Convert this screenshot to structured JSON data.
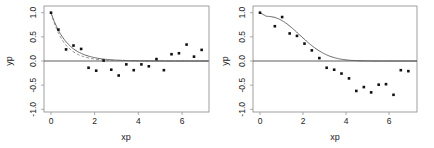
{
  "chart_data": [
    {
      "type": "scatter",
      "title": "",
      "xlabel": "xp",
      "ylabel": "yp",
      "xlim": [
        -0.2,
        7.0
      ],
      "ylim": [
        -1.1,
        1.1
      ],
      "xticks": [
        "0",
        "2",
        "4",
        "6"
      ],
      "yticks": [
        "-1.0",
        "-0.5",
        "0.0",
        "0.5",
        "1.0"
      ],
      "grid": false,
      "hline": 0,
      "points": {
        "x": [
          0,
          0.34,
          0.69,
          1.03,
          1.38,
          1.72,
          2.07,
          2.41,
          2.76,
          3.1,
          3.45,
          3.79,
          4.14,
          4.48,
          4.83,
          5.17,
          5.52,
          5.86,
          6.21,
          6.55,
          6.9
        ],
        "y": [
          1.0,
          0.65,
          0.24,
          0.32,
          0.25,
          -0.14,
          -0.2,
          0.01,
          -0.18,
          -0.3,
          -0.07,
          -0.19,
          -0.07,
          -0.11,
          0.04,
          -0.19,
          0.14,
          0.16,
          0.34,
          0.09,
          0.23
        ]
      },
      "series": [
        {
          "name": "fit-solid",
          "style": "solid",
          "form": "exp(-x/0.75)"
        },
        {
          "name": "fit-dashed",
          "style": "dashed",
          "form": "exp(-x/0.62)"
        }
      ]
    },
    {
      "type": "scatter",
      "title": "",
      "xlabel": "xp",
      "ylabel": "yp",
      "xlim": [
        -0.2,
        7.0
      ],
      "ylim": [
        -1.1,
        1.1
      ],
      "xticks": [
        "0",
        "2",
        "4",
        "6"
      ],
      "yticks": [
        "-1.0",
        "-0.5",
        "0.0",
        "0.5",
        "1.0"
      ],
      "grid": false,
      "hline": 0,
      "points": {
        "x": [
          0,
          0.69,
          1.03,
          1.38,
          1.72,
          2.07,
          2.41,
          2.76,
          3.1,
          3.45,
          3.79,
          4.14,
          4.48,
          4.83,
          5.17,
          5.52,
          5.86,
          6.21,
          6.55,
          6.9
        ],
        "y": [
          1.0,
          0.72,
          0.91,
          0.57,
          0.52,
          0.36,
          0.22,
          0.06,
          -0.14,
          -0.18,
          -0.26,
          -0.36,
          -0.62,
          -0.54,
          -0.65,
          -0.49,
          -0.48,
          -0.7,
          -0.19,
          -0.21
        ]
      },
      "series": [
        {
          "name": "fit-solid",
          "style": "solid",
          "form": "gaussian-like decay from 1 to 0 near x=4"
        }
      ]
    }
  ],
  "plots": [
    {
      "xlabel": "xp",
      "ylabel": "yp",
      "xticks": [
        "0",
        "2",
        "4",
        "6"
      ],
      "yticks": [
        "-1.0",
        "-0.5",
        "0.0",
        "0.5",
        "1.0"
      ]
    },
    {
      "xlabel": "xp",
      "ylabel": "yp",
      "xticks": [
        "0",
        "2",
        "4",
        "6"
      ],
      "yticks": [
        "-1.0",
        "-0.5",
        "0.0",
        "0.5",
        "1.0"
      ]
    }
  ]
}
